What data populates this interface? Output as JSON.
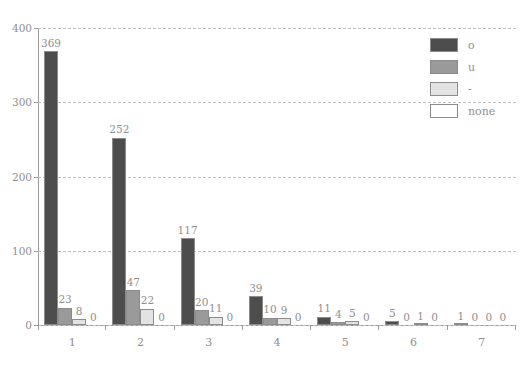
{
  "chart_data": {
    "type": "bar",
    "title": "",
    "subtitle": "",
    "xlabel": "",
    "ylabel": "",
    "categories": [
      "1",
      "2",
      "3",
      "4",
      "5",
      "6",
      "7"
    ],
    "series": [
      {
        "name": "o",
        "color": "#4d4d4d",
        "values": [
          369,
          252,
          117,
          39,
          11,
          5,
          1
        ]
      },
      {
        "name": "u",
        "color": "#9a9a9a",
        "values": [
          23,
          47,
          20,
          10,
          4,
          0,
          0
        ]
      },
      {
        "name": "-",
        "color": "#e3e3e3",
        "values": [
          8,
          22,
          11,
          9,
          5,
          1,
          0
        ]
      },
      {
        "name": "none",
        "color": "#ffffff",
        "values": [
          0,
          0,
          0,
          0,
          0,
          0,
          0
        ]
      }
    ],
    "yticks": [
      0,
      100,
      200,
      300,
      400
    ],
    "ylim": [
      0,
      400
    ],
    "grid": true,
    "grid_style": "dashed-horizontal",
    "legend_position": "top-right",
    "value_labels": true,
    "bar_border_color": "#8c8c8c",
    "axis_color": "#9a9a9a",
    "text_color": "#8f8f8f",
    "background": "#ffffff"
  },
  "legend": {
    "items": [
      {
        "label": "o"
      },
      {
        "label": "u"
      },
      {
        "label": "-"
      },
      {
        "label": "none"
      }
    ]
  }
}
